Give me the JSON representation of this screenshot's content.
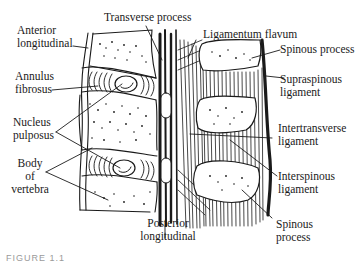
{
  "figure": {
    "caption": "FIGURE 1.1"
  },
  "labels": {
    "anterior_longitudinal": [
      "Anterior",
      "longitudinal"
    ],
    "annulus_fibrosus": [
      "Annulus",
      "fibrosus"
    ],
    "nucleus_pulposus": [
      "Nucleus",
      "pulposus"
    ],
    "body_of_vertebra": [
      "Body",
      "of",
      "vertebra"
    ],
    "transverse_process": "Transverse process",
    "ligamentum_flavum": "Ligamentum flavum",
    "spinous_process_top": "Spinous process",
    "supraspinous_ligament": [
      "Supraspinous",
      "ligament"
    ],
    "intertransverse_ligament": [
      "Intertransverse",
      "ligament"
    ],
    "interspinous_ligament": [
      "Interspinous",
      "ligament"
    ],
    "posterior_longitudinal": [
      "Posterior",
      "longitudinal"
    ],
    "spinous_process_bottom": [
      "Spinous",
      "process"
    ]
  },
  "colors": {
    "ink": "#1a1a1a",
    "paper": "#ffffff"
  }
}
